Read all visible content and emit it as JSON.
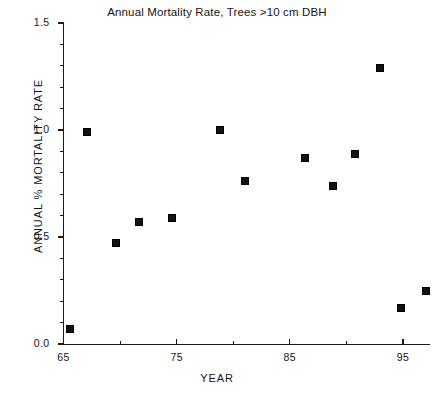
{
  "chart_data": {
    "type": "scatter",
    "title": "Annual Mortality Rate, Trees >10 cm DBH",
    "xlabel": "YEAR",
    "ylabel": "ANNUAL % MORTALITY RATE",
    "xlim": [
      65,
      97.8
    ],
    "ylim": [
      0.0,
      1.5
    ],
    "grid": false,
    "legend": null,
    "marker": "filled-square",
    "marker_color": "#121212",
    "x_ticks_major": [
      "65",
      "75",
      "85",
      "95"
    ],
    "x_tick_major_values": [
      65,
      75,
      85,
      95
    ],
    "x_tick_minor_values": [
      70,
      80,
      90
    ],
    "y_ticks_major": [
      "0.0",
      "0.5",
      "1.0",
      "1.5"
    ],
    "y_tick_major_values": [
      0.0,
      0.5,
      1.0,
      1.5
    ],
    "y_tick_minor_values": [
      0.1,
      0.2,
      0.3,
      0.4,
      0.6,
      0.7,
      0.8,
      0.9,
      1.1,
      1.2,
      1.3,
      1.4
    ],
    "x": [
      65.6,
      67.1,
      69.6,
      71.7,
      74.6,
      78.8,
      81.0,
      86.3,
      88.8,
      90.8,
      93.0,
      94.8,
      97.0
    ],
    "y": [
      0.07,
      0.99,
      0.47,
      0.57,
      0.59,
      1.0,
      0.76,
      0.87,
      0.74,
      0.89,
      1.29,
      0.17,
      0.25
    ],
    "points": [
      {
        "x": 65.6,
        "y": 0.07
      },
      {
        "x": 67.1,
        "y": 0.99
      },
      {
        "x": 69.6,
        "y": 0.47
      },
      {
        "x": 71.7,
        "y": 0.57
      },
      {
        "x": 74.6,
        "y": 0.59
      },
      {
        "x": 78.8,
        "y": 1.0
      },
      {
        "x": 81.0,
        "y": 0.76
      },
      {
        "x": 86.3,
        "y": 0.87
      },
      {
        "x": 88.8,
        "y": 0.74
      },
      {
        "x": 90.8,
        "y": 0.89
      },
      {
        "x": 93.0,
        "y": 1.29
      },
      {
        "x": 94.8,
        "y": 0.17
      },
      {
        "x": 97.0,
        "y": 0.25
      }
    ]
  },
  "colors": {
    "axis": "#1a1a1a",
    "text": "#141414",
    "marker": "#121212",
    "background": "#ffffff"
  }
}
